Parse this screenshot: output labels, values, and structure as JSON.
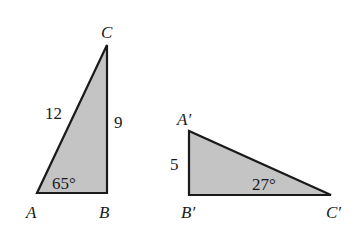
{
  "triangles": [
    {
      "name": "ABC",
      "vertices": {
        "A": {
          "label": "A"
        },
        "B": {
          "label": "B"
        },
        "C": {
          "label": "C"
        }
      },
      "sides": {
        "AC": "12",
        "BC": "9"
      },
      "angles": {
        "A": "65°"
      }
    },
    {
      "name": "A'B'C'",
      "vertices": {
        "A": {
          "label": "A′"
        },
        "B": {
          "label": "B′"
        },
        "C": {
          "label": "C′"
        }
      },
      "sides": {
        "AB": "5"
      },
      "angles": {
        "C": "27°"
      }
    }
  ],
  "colors": {
    "fill": "#c4c4c4",
    "stroke": "#1a1a1a"
  }
}
